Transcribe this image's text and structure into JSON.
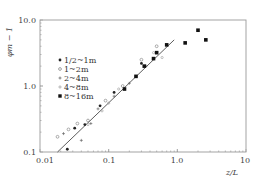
{
  "chart_data": {
    "type": "scatter",
    "title": "",
    "xlabel": "z/L",
    "ylabel": "φm − 1",
    "xscale": "log",
    "yscale": "log",
    "xlim": [
      0.01,
      10
    ],
    "ylim": [
      0.1,
      10
    ],
    "x_ticks": [
      "0.01",
      "0.1",
      "1.0",
      "10"
    ],
    "y_ticks": [
      "0.1",
      "1.0",
      "10.0"
    ],
    "grid": false,
    "legend_position": "upper-left (inside)",
    "series": [
      {
        "name": "1/2~1m",
        "marker": "small-filled-circle",
        "points": [
          [
            0.025,
            0.11
          ],
          [
            0.032,
            0.23
          ],
          [
            0.045,
            0.26
          ],
          [
            0.075,
            0.5
          ],
          [
            0.12,
            0.8
          ],
          [
            0.3,
            2.2
          ]
        ]
      },
      {
        "name": "1~2m",
        "marker": "open-circle",
        "points": [
          [
            0.018,
            0.17
          ],
          [
            0.026,
            0.22
          ],
          [
            0.035,
            0.27
          ],
          [
            0.05,
            0.3
          ],
          [
            0.09,
            0.6
          ],
          [
            0.16,
            1.0
          ],
          [
            0.3,
            2.5
          ],
          [
            0.5,
            4.0
          ]
        ]
      },
      {
        "name": "2~4m",
        "marker": "plus",
        "points": [
          [
            0.022,
            0.19
          ],
          [
            0.04,
            0.15
          ],
          [
            0.055,
            0.27
          ],
          [
            0.07,
            0.45
          ],
          [
            0.12,
            0.7
          ],
          [
            0.2,
            1.1
          ],
          [
            0.35,
            2.0
          ]
        ]
      },
      {
        "name": "4~8m",
        "marker": "small-dot-open",
        "points": [
          [
            0.05,
            0.26
          ],
          [
            0.08,
            0.42
          ],
          [
            0.1,
            0.55
          ],
          [
            0.14,
            0.9
          ],
          [
            0.25,
            1.4
          ],
          [
            0.45,
            3.2
          ],
          [
            0.6,
            2.7
          ]
        ]
      },
      {
        "name": "8~16m",
        "marker": "filled-square",
        "points": [
          [
            0.17,
            0.9
          ],
          [
            0.25,
            1.4
          ],
          [
            0.33,
            2.0
          ],
          [
            0.45,
            2.6
          ],
          [
            0.5,
            3.2
          ],
          [
            0.7,
            4.2
          ],
          [
            1.3,
            4.5
          ],
          [
            2.0,
            7.0
          ],
          [
            2.6,
            5.0
          ]
        ]
      }
    ],
    "fit_line": {
      "description": "straight reference line (log-log)",
      "points": [
        [
          0.018,
          0.1
        ],
        [
          0.9,
          5.0
        ]
      ]
    }
  },
  "legend": {
    "entries": [
      {
        "label": "1/2~1m",
        "marker": "•"
      },
      {
        "label": "1~2m",
        "marker": "◦"
      },
      {
        "label": "2~4m",
        "marker": "+"
      },
      {
        "label": "4~8m",
        "marker": "◦"
      },
      {
        "label": "8~16m",
        "marker": "■"
      }
    ]
  },
  "axes": {
    "xlabel": "z/L",
    "ylabel": "φm − 1",
    "x_tick_labels": [
      "0.01",
      "0.1",
      "1.0",
      "10"
    ],
    "y_tick_labels": [
      "0.1",
      "1.0",
      "10.0"
    ]
  }
}
